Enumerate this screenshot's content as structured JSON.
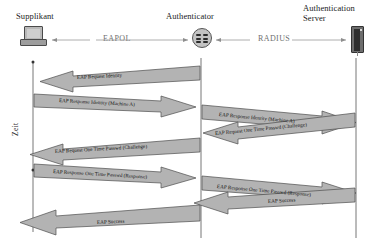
{
  "diagram": {
    "time_axis_label": "Zeit",
    "colors": {
      "arrow_fill": "#b0b0b0",
      "arrow_stroke": "#4d4d4d",
      "lifeline": "#555555",
      "protocol_text": "#6f6f6f",
      "background": "#ffffff"
    },
    "actors": [
      {
        "id": "supplicant",
        "label": "Supplikant",
        "icon": "desktop-computer-icon",
        "x": 33
      },
      {
        "id": "authenticator",
        "label": "Authenticator",
        "icon": "network-hub-icon",
        "x": 201
      },
      {
        "id": "auth-server",
        "label": "Authentication\nServer",
        "icon": "server-tower-icon",
        "x": 356
      }
    ],
    "protocol_links": [
      {
        "id": "eapol",
        "label": "EAPOL",
        "from": "supplicant",
        "to": "authenticator",
        "bidirectional": true
      },
      {
        "id": "radius",
        "label": "RADIUS",
        "from": "authenticator",
        "to": "auth-server",
        "bidirectional": true
      }
    ],
    "messages": [
      {
        "seq": 1,
        "label": "EAP Request Identity",
        "segment": "eapol",
        "direction": "right-to-left"
      },
      {
        "seq": 2,
        "label": "EAP Response Identity (Machine A)",
        "segment": "eapol",
        "direction": "left-to-right"
      },
      {
        "seq": 3,
        "label": "EAP Response Identity (Machine A)",
        "segment": "radius",
        "direction": "left-to-right"
      },
      {
        "seq": 4,
        "label": "EAP Request One Time Passwd (Challenge)",
        "segment": "radius",
        "direction": "right-to-left"
      },
      {
        "seq": 5,
        "label": "EAP Request One Time Passwd (Challenge)",
        "segment": "eapol",
        "direction": "right-to-left"
      },
      {
        "seq": 6,
        "label": "EAP Response One Time Passwd (Response)",
        "segment": "eapol",
        "direction": "left-to-right"
      },
      {
        "seq": 7,
        "label": "EAP Response One Time Passwd (Response)",
        "segment": "radius",
        "direction": "left-to-right"
      },
      {
        "seq": 8,
        "label": "EAP Success",
        "segment": "radius",
        "direction": "right-to-left"
      },
      {
        "seq": 9,
        "label": "EAP Success",
        "segment": "eapol",
        "direction": "right-to-left"
      }
    ]
  }
}
